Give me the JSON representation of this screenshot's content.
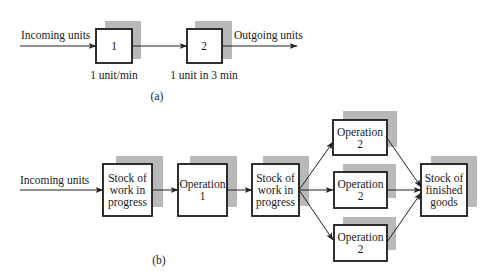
{
  "figure_a": {
    "input_label": "Incoming units",
    "output_label": "Outgoing units",
    "stations": [
      {
        "id": "1",
        "rate": "1 unit/min"
      },
      {
        "id": "2",
        "rate": "1 unit in 3 min"
      }
    ],
    "caption": "(a)"
  },
  "figure_b": {
    "input_label": "Incoming units",
    "nodes": {
      "wip1": {
        "lines": [
          "Stock of",
          "work in",
          "progress"
        ]
      },
      "op1": {
        "lines": [
          "Operation",
          "1"
        ]
      },
      "wip2": {
        "lines": [
          "Stock of",
          "work in",
          "progress"
        ]
      },
      "op2_top": {
        "lines": [
          "Operation",
          "2"
        ]
      },
      "op2_mid": {
        "lines": [
          "Operation",
          "2"
        ]
      },
      "op2_bot": {
        "lines": [
          "Operation",
          "2"
        ]
      },
      "finished": {
        "lines": [
          "Stock of",
          "finished",
          "goods"
        ]
      }
    },
    "caption": "(b)"
  },
  "colors": {
    "box_stroke": "#1a1a1a",
    "shadow": "#b9b9b9",
    "background": "#ffffff"
  }
}
